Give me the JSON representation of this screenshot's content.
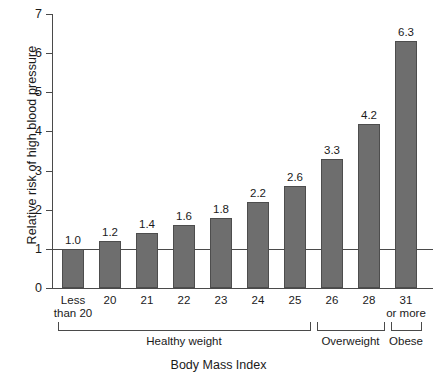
{
  "chart_data": {
    "type": "bar",
    "title": "",
    "xlabel": "Body Mass Index",
    "ylabel": "Relative risk of high blood pressure",
    "categories": [
      "Less than 20",
      "20",
      "21",
      "22",
      "23",
      "24",
      "25",
      "26",
      "28",
      "31 or more"
    ],
    "category_lines": [
      [
        "Less",
        "than 20"
      ],
      [
        "20"
      ],
      [
        "21"
      ],
      [
        "22"
      ],
      [
        "23"
      ],
      [
        "24"
      ],
      [
        "25"
      ],
      [
        "26"
      ],
      [
        "28"
      ],
      [
        "31",
        "or more"
      ]
    ],
    "values": [
      1.0,
      1.2,
      1.4,
      1.6,
      1.8,
      2.2,
      2.6,
      3.3,
      4.2,
      6.3
    ],
    "value_labels": [
      "1.0",
      "1.2",
      "1.4",
      "1.6",
      "1.8",
      "2.2",
      "2.6",
      "3.3",
      "4.2",
      "6.3"
    ],
    "ylim": [
      0,
      7
    ],
    "y_ticks": [
      0,
      1,
      2,
      3,
      4,
      5,
      6,
      7
    ],
    "y_tick_labels": [
      "0",
      "1",
      "2",
      "3",
      "4",
      "5",
      "6",
      "7"
    ],
    "grid": false,
    "legend": "none",
    "reference_line": {
      "value": 1.0,
      "label": ""
    },
    "bar_color": "#6e6e6e",
    "bar_border_color": "#4d4d4d",
    "axis_color": "#4a4a4a",
    "text_color": "#1a1a1a",
    "background_color": "#ffffff",
    "groups": [
      {
        "label": "Healthy weight",
        "start_index": 0,
        "end_index": 6
      },
      {
        "label": "Overweight",
        "start_index": 7,
        "end_index": 8
      },
      {
        "label": "Obese",
        "start_index": 9,
        "end_index": 9
      }
    ]
  }
}
